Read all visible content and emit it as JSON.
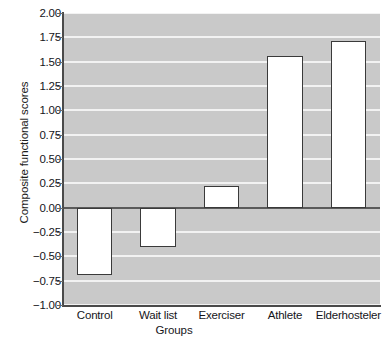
{
  "chart_data": {
    "type": "bar",
    "title": "",
    "subtitle": "",
    "xlabel": "Groups",
    "ylabel": "Composite functional scores",
    "categories": [
      "Control",
      "Wait list",
      "Exerciser",
      "Athlete",
      "Elderhosteler"
    ],
    "values": [
      -0.69,
      -0.4,
      0.22,
      1.56,
      1.71
    ],
    "series": [
      {
        "name": "Composite functional scores",
        "values": [
          -0.69,
          -0.4,
          0.22,
          1.56,
          1.71
        ]
      }
    ],
    "ylim": [
      -1.0,
      2.0
    ],
    "yticks": [
      2.0,
      1.75,
      1.5,
      1.25,
      1.0,
      0.75,
      0.5,
      0.25,
      0.0,
      -0.25,
      -0.5,
      -0.75,
      -1.0
    ],
    "ytick_labels": [
      "2.00",
      "1.75",
      "1.50",
      "1.25",
      "1.00",
      "0.75",
      "0.50",
      "0.25",
      "0.00",
      "−0.25",
      "−0.50",
      "−0.75",
      "−1.00"
    ],
    "grid": true,
    "grid_color": "#f2f2f2",
    "plot_background": "#c9c9c9",
    "bar_fill": "#ffffff",
    "bar_edge": "#3a3a3a",
    "axis_color": "#4a4a4a",
    "zero_line": 0.0,
    "legend": null,
    "legend_position": "none",
    "annotations": []
  }
}
